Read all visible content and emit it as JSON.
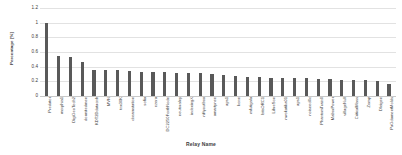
{
  "chart_data": {
    "type": "bar",
    "title": "",
    "xlabel": "Relay Name",
    "ylabel": "Percentage [%]",
    "ylim": [
      0,
      1.2
    ],
    "grid": true,
    "legend": "none",
    "bar_color": "#595959",
    "gridline_color": "#e2e2e2",
    "yticks": [
      "0",
      "0.2",
      "0.4",
      "0.6",
      "0.8",
      "1",
      "1.2"
    ],
    "ytick_values": [
      0,
      0.2,
      0.4,
      0.6,
      0.8,
      1,
      1.2
    ],
    "categories": [
      "Predator",
      "morphia1",
      "DigiGeoTech2",
      "dormitedmen",
      "KDT2Ddatacnb",
      "MVN",
      "tnx30K",
      "dreamstation",
      "sofia",
      "ezera",
      "DC2250ForthNode",
      "neutoralny",
      "indexingX",
      "niftyoutbox",
      "amartynee",
      "aps1",
      "kone",
      "mfutigala",
      "bitsORC1",
      "LibreSon",
      "nwokatika01",
      "aps1",
      "noiseed0c",
      "PhantomTrain0",
      "MaborPower",
      "villageNull",
      "CriticalMass",
      "Zomp",
      "Dleigen",
      "PaGdamentMolds"
    ],
    "values": [
      1.0,
      0.55,
      0.53,
      0.47,
      0.36,
      0.35,
      0.35,
      0.34,
      0.33,
      0.33,
      0.33,
      0.32,
      0.32,
      0.31,
      0.3,
      0.28,
      0.27,
      0.26,
      0.26,
      0.25,
      0.25,
      0.24,
      0.24,
      0.23,
      0.23,
      0.22,
      0.22,
      0.22,
      0.21,
      0.17
    ]
  }
}
